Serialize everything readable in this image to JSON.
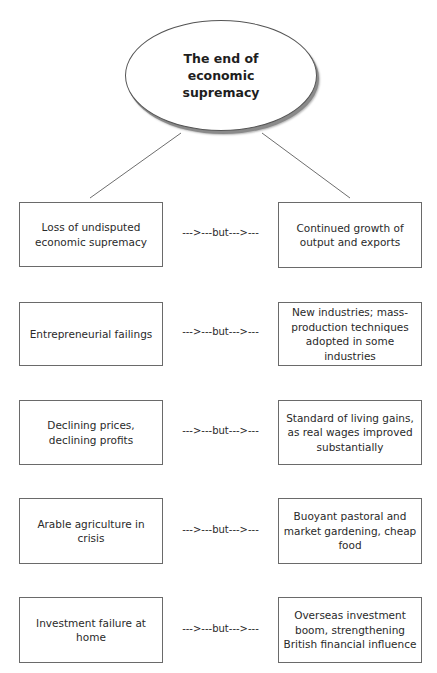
{
  "diagram": {
    "title": "The end of economic supremacy",
    "title_lines": [
      "The end of",
      "economic supremacy"
    ],
    "connector_label": "--->---but--->---",
    "rows": [
      {
        "left": "Loss of undisputed economic supremacy",
        "connector": "--->---but--->---",
        "right": "Continued growth of output and exports"
      },
      {
        "left": "Entrepreneurial failings",
        "connector": "--->---but--->---",
        "right": "New industries; mass-production techniques adopted in some industries"
      },
      {
        "left": "Declining prices, declining profits",
        "connector": "--->---but--->---",
        "right": "Standard of living gains, as real wages improved substantially"
      },
      {
        "left": "Arable agriculture in crisis",
        "connector": "--->---but--->---",
        "right": "Buoyant pastoral and market gardening, cheap food"
      },
      {
        "left": "Investment failure at home",
        "connector": "--->---but--->---",
        "right": "Overseas investment boom, strengthening British financial influence"
      }
    ],
    "colors": {
      "border": "#6a6a6a",
      "shadow": "#8a8a8a",
      "text": "#2a2a2a",
      "background": "#ffffff"
    }
  }
}
